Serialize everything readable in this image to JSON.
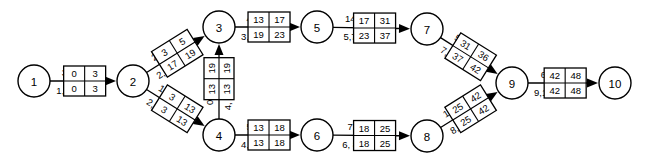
{
  "diagram": {
    "type": "activity-on-arrow-network",
    "stroke_color": "#000000",
    "background_color": "#ffffff",
    "nodes": [
      {
        "id": "1",
        "label": "1",
        "x": 34,
        "y": 81,
        "r": 16
      },
      {
        "id": "2",
        "label": "2",
        "x": 133,
        "y": 81,
        "r": 16
      },
      {
        "id": "3",
        "label": "3",
        "x": 219,
        "y": 27,
        "r": 16
      },
      {
        "id": "4",
        "label": "4",
        "x": 219,
        "y": 135,
        "r": 16
      },
      {
        "id": "5",
        "label": "5",
        "x": 317,
        "y": 27,
        "r": 16
      },
      {
        "id": "6",
        "label": "6",
        "x": 317,
        "y": 135,
        "r": 16
      },
      {
        "id": "7",
        "label": "7",
        "x": 427,
        "y": 29,
        "r": 16
      },
      {
        "id": "8",
        "label": "8",
        "x": 427,
        "y": 136,
        "r": 16
      },
      {
        "id": "9",
        "label": "9",
        "x": 512,
        "y": 83,
        "r": 16
      },
      {
        "id": "10",
        "label": "10",
        "x": 615,
        "y": 83,
        "r": 16
      }
    ],
    "edges": [
      {
        "id": "e-1-2",
        "from": "1",
        "to": "2",
        "activity_label": "1, 2",
        "duration": "3",
        "box": {
          "top_left": "0",
          "top_right": "3",
          "bottom_left": "0",
          "bottom_right": "3"
        },
        "angle": 0
      },
      {
        "id": "e-2-3",
        "from": "2",
        "to": "3",
        "activity_label": "2, 3",
        "duration": "2",
        "box": {
          "top_left": "3",
          "top_right": "5",
          "bottom_left": "17",
          "bottom_right": "19"
        },
        "angle": -32
      },
      {
        "id": "e-2-4",
        "from": "2",
        "to": "4",
        "activity_label": "2, 4",
        "duration": "10",
        "box": {
          "top_left": "3",
          "top_right": "13",
          "bottom_left": "3",
          "bottom_right": "13"
        },
        "angle": 32
      },
      {
        "id": "e-4-3",
        "from": "4",
        "to": "3",
        "activity_label": "4, 3",
        "duration": "0",
        "box": {
          "top_left": "13",
          "top_right": "19",
          "bottom_left": "13",
          "bottom_right": "19"
        },
        "angle": -90
      },
      {
        "id": "e-3-5",
        "from": "3",
        "to": "5",
        "activity_label": "3, 5",
        "duration": "4",
        "box": {
          "top_left": "13",
          "top_right": "17",
          "bottom_left": "19",
          "bottom_right": "23"
        },
        "angle": 0
      },
      {
        "id": "e-5-7",
        "from": "5",
        "to": "7",
        "activity_label": "5,7",
        "duration": "14",
        "box": {
          "top_left": "17",
          "top_right": "31",
          "bottom_left": "23",
          "bottom_right": "37"
        },
        "angle": 0
      },
      {
        "id": "e-7-9",
        "from": "7",
        "to": "9",
        "activity_label": "7, 9",
        "duration": "5",
        "box": {
          "top_left": "31",
          "top_right": "36",
          "bottom_left": "37",
          "bottom_right": "42"
        },
        "angle": 32
      },
      {
        "id": "e-4-6",
        "from": "4",
        "to": "6",
        "activity_label": "4, 6",
        "duration": "5",
        "box": {
          "top_left": "13",
          "top_right": "18",
          "bottom_left": "13",
          "bottom_right": "18"
        },
        "angle": 0
      },
      {
        "id": "e-6-8",
        "from": "6",
        "to": "8",
        "activity_label": "6, 8",
        "duration": "7",
        "box": {
          "top_left": "18",
          "top_right": "25",
          "bottom_left": "18",
          "bottom_right": "25"
        },
        "angle": 0
      },
      {
        "id": "e-8-9",
        "from": "8",
        "to": "9",
        "activity_label": "8, 9",
        "duration": "17",
        "box": {
          "top_left": "25",
          "top_right": "42",
          "bottom_left": "25",
          "bottom_right": "42"
        },
        "angle": -32
      },
      {
        "id": "e-9-10",
        "from": "9",
        "to": "10",
        "activity_label": "9,10",
        "duration": "6",
        "box": {
          "top_left": "42",
          "top_right": "48",
          "bottom_left": "42",
          "bottom_right": "48"
        },
        "angle": 0
      }
    ]
  }
}
